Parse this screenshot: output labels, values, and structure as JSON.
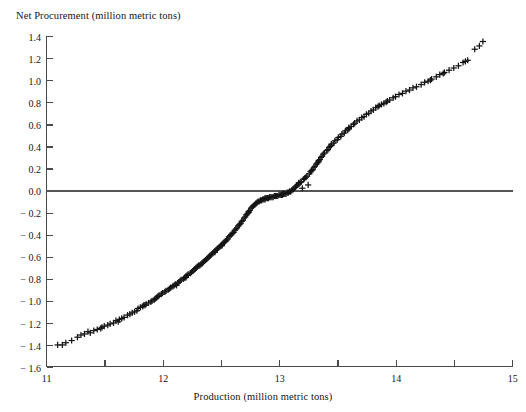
{
  "figure": {
    "caption_remnant": "",
    "background": "#ffffff",
    "ink_color": "#151515"
  },
  "chart_data": {
    "type": "scatter",
    "title": "",
    "ylabel": "Net Procurement (million metric tons)",
    "xlabel": "Production (million metric tons)",
    "xlim": [
      11,
      15
    ],
    "ylim": [
      -1.6,
      1.4
    ],
    "grid": false,
    "legend": null,
    "marker": "plus",
    "marker_color": "#151515",
    "reference_line": {
      "orientation": "horizontal",
      "y": 0.0,
      "color": "#555555"
    },
    "xticks": [
      11,
      11.5,
      12,
      12.5,
      13,
      13.5,
      14,
      14.5,
      15
    ],
    "xtick_labels": [
      "11",
      "",
      "12",
      "",
      "13",
      "",
      "14",
      "",
      "15"
    ],
    "yticks": [
      1.4,
      1.2,
      1.0,
      0.8,
      0.6,
      0.4,
      0.2,
      0.0,
      -0.2,
      -0.4,
      -0.6,
      -0.8,
      -1.0,
      -1.2,
      -1.4,
      -1.6
    ],
    "ytick_labels": [
      "1.4",
      "1.2",
      "1.0",
      "0.8",
      "0.6",
      "0.4",
      "0.2",
      "0.0",
      "− 0.2",
      "− 0.4",
      "− 0.6",
      "− 0.8",
      "− 1.0",
      "− 1.2",
      "− 1.4",
      "− 1.6"
    ],
    "n_points": 212,
    "points": [
      [
        11.1,
        -1.4
      ],
      [
        11.14,
        -1.4
      ],
      [
        11.17,
        -1.38
      ],
      [
        11.22,
        -1.36
      ],
      [
        11.27,
        -1.33
      ],
      [
        11.33,
        -1.3
      ],
      [
        11.36,
        -1.28
      ],
      [
        11.38,
        -1.29
      ],
      [
        11.41,
        -1.27
      ],
      [
        11.44,
        -1.26
      ],
      [
        11.47,
        -1.25
      ],
      [
        11.5,
        -1.23
      ],
      [
        11.53,
        -1.22
      ],
      [
        11.55,
        -1.21
      ],
      [
        11.58,
        -1.2
      ],
      [
        11.6,
        -1.18
      ],
      [
        11.62,
        -1.19
      ],
      [
        11.65,
        -1.16
      ],
      [
        11.67,
        -1.15
      ],
      [
        11.7,
        -1.13
      ],
      [
        11.72,
        -1.12
      ],
      [
        11.74,
        -1.11
      ],
      [
        11.76,
        -1.1
      ],
      [
        11.78,
        -1.09
      ],
      [
        11.79,
        -1.07
      ],
      [
        11.81,
        -1.06
      ],
      [
        11.83,
        -1.05
      ],
      [
        11.85,
        -1.04
      ],
      [
        11.86,
        -1.03
      ],
      [
        11.88,
        -1.02
      ],
      [
        11.9,
        -1.01
      ],
      [
        11.91,
        -1.0
      ],
      [
        11.93,
        -0.99
      ],
      [
        11.94,
        -0.98
      ],
      [
        11.96,
        -0.96
      ],
      [
        11.97,
        -0.95
      ],
      [
        11.99,
        -0.94
      ],
      [
        12.0,
        -0.93
      ],
      [
        12.02,
        -0.92
      ],
      [
        12.03,
        -0.91
      ],
      [
        12.05,
        -0.9
      ],
      [
        12.06,
        -0.89
      ],
      [
        12.07,
        -0.88
      ],
      [
        12.09,
        -0.87
      ],
      [
        12.1,
        -0.86
      ],
      [
        12.11,
        -0.85
      ],
      [
        12.13,
        -0.84
      ],
      [
        12.14,
        -0.83
      ],
      [
        12.15,
        -0.82
      ],
      [
        12.16,
        -0.81
      ],
      [
        12.18,
        -0.8
      ],
      [
        12.19,
        -0.79
      ],
      [
        12.2,
        -0.78
      ],
      [
        12.21,
        -0.77
      ],
      [
        12.22,
        -0.76
      ],
      [
        12.24,
        -0.75
      ],
      [
        12.25,
        -0.74
      ],
      [
        12.26,
        -0.73
      ],
      [
        12.27,
        -0.72
      ],
      [
        12.28,
        -0.71
      ],
      [
        12.29,
        -0.7
      ],
      [
        12.3,
        -0.69
      ],
      [
        12.31,
        -0.68
      ],
      [
        12.33,
        -0.67
      ],
      [
        12.34,
        -0.66
      ],
      [
        12.35,
        -0.65
      ],
      [
        12.36,
        -0.64
      ],
      [
        12.37,
        -0.63
      ],
      [
        12.38,
        -0.62
      ],
      [
        12.39,
        -0.61
      ],
      [
        12.4,
        -0.6
      ],
      [
        12.41,
        -0.59
      ],
      [
        12.42,
        -0.58
      ],
      [
        12.43,
        -0.57
      ],
      [
        12.44,
        -0.56
      ],
      [
        12.45,
        -0.55
      ],
      [
        12.46,
        -0.54
      ],
      [
        12.47,
        -0.53
      ],
      [
        12.48,
        -0.52
      ],
      [
        12.49,
        -0.51
      ],
      [
        12.5,
        -0.5
      ],
      [
        12.51,
        -0.49
      ],
      [
        12.52,
        -0.48
      ],
      [
        12.53,
        -0.47
      ],
      [
        12.54,
        -0.46
      ],
      [
        12.55,
        -0.45
      ],
      [
        12.56,
        -0.44
      ],
      [
        12.57,
        -0.42
      ],
      [
        12.58,
        -0.41
      ],
      [
        12.59,
        -0.4
      ],
      [
        12.6,
        -0.39
      ],
      [
        12.61,
        -0.38
      ],
      [
        12.62,
        -0.36
      ],
      [
        12.63,
        -0.35
      ],
      [
        12.64,
        -0.34
      ],
      [
        12.65,
        -0.32
      ],
      [
        12.66,
        -0.31
      ],
      [
        12.67,
        -0.3
      ],
      [
        12.68,
        -0.28
      ],
      [
        12.69,
        -0.27
      ],
      [
        12.7,
        -0.25
      ],
      [
        12.71,
        -0.24
      ],
      [
        12.72,
        -0.22
      ],
      [
        12.73,
        -0.21
      ],
      [
        12.74,
        -0.19
      ],
      [
        12.75,
        -0.18
      ],
      [
        12.76,
        -0.16
      ],
      [
        12.77,
        -0.15
      ],
      [
        12.78,
        -0.14
      ],
      [
        12.79,
        -0.13
      ],
      [
        12.8,
        -0.12
      ],
      [
        12.81,
        -0.11
      ],
      [
        12.82,
        -0.1
      ],
      [
        12.83,
        -0.1
      ],
      [
        12.84,
        -0.09
      ],
      [
        12.85,
        -0.09
      ],
      [
        12.86,
        -0.08
      ],
      [
        12.87,
        -0.08
      ],
      [
        12.88,
        -0.08
      ],
      [
        12.89,
        -0.07
      ],
      [
        12.9,
        -0.07
      ],
      [
        12.91,
        -0.07
      ],
      [
        12.92,
        -0.06
      ],
      [
        12.93,
        -0.06
      ],
      [
        12.94,
        -0.06
      ],
      [
        12.95,
        -0.06
      ],
      [
        12.96,
        -0.05
      ],
      [
        12.97,
        -0.05
      ],
      [
        12.98,
        -0.05
      ],
      [
        12.99,
        -0.05
      ],
      [
        13.0,
        -0.04
      ],
      [
        13.01,
        -0.04
      ],
      [
        13.02,
        -0.04
      ],
      [
        13.03,
        -0.04
      ],
      [
        13.04,
        -0.03
      ],
      [
        13.05,
        -0.03
      ],
      [
        13.06,
        -0.03
      ],
      [
        13.07,
        -0.02
      ],
      [
        13.08,
        -0.02
      ],
      [
        13.09,
        -0.01
      ],
      [
        13.1,
        -0.01
      ],
      [
        13.11,
        0.0
      ],
      [
        13.12,
        0.01
      ],
      [
        13.13,
        0.02
      ],
      [
        13.14,
        0.03
      ],
      [
        13.15,
        0.04
      ],
      [
        13.16,
        0.05
      ],
      [
        13.17,
        0.06
      ],
      [
        13.18,
        0.07
      ],
      [
        13.19,
        0.08
      ],
      [
        13.2,
        0.02
      ],
      [
        13.21,
        0.1
      ],
      [
        13.22,
        0.11
      ],
      [
        13.23,
        0.12
      ],
      [
        13.24,
        0.13
      ],
      [
        13.25,
        0.05
      ],
      [
        13.26,
        0.15
      ],
      [
        13.27,
        0.17
      ],
      [
        13.28,
        0.18
      ],
      [
        13.29,
        0.19
      ],
      [
        13.3,
        0.21
      ],
      [
        13.31,
        0.22
      ],
      [
        13.32,
        0.24
      ],
      [
        13.33,
        0.25
      ],
      [
        13.34,
        0.27
      ],
      [
        13.35,
        0.28
      ],
      [
        13.36,
        0.3
      ],
      [
        13.37,
        0.31
      ],
      [
        13.38,
        0.33
      ],
      [
        13.39,
        0.34
      ],
      [
        13.41,
        0.36
      ],
      [
        13.42,
        0.37
      ],
      [
        13.43,
        0.39
      ],
      [
        13.44,
        0.4
      ],
      [
        13.45,
        0.42
      ],
      [
        13.47,
        0.43
      ],
      [
        13.48,
        0.45
      ],
      [
        13.5,
        0.46
      ],
      [
        13.51,
        0.48
      ],
      [
        13.53,
        0.49
      ],
      [
        13.54,
        0.51
      ],
      [
        13.56,
        0.52
      ],
      [
        13.57,
        0.54
      ],
      [
        13.59,
        0.55
      ],
      [
        13.6,
        0.57
      ],
      [
        13.62,
        0.58
      ],
      [
        13.64,
        0.6
      ],
      [
        13.65,
        0.61
      ],
      [
        13.67,
        0.63
      ],
      [
        13.69,
        0.64
      ],
      [
        13.71,
        0.66
      ],
      [
        13.73,
        0.67
      ],
      [
        13.75,
        0.69
      ],
      [
        13.77,
        0.7
      ],
      [
        13.79,
        0.72
      ],
      [
        13.81,
        0.73
      ],
      [
        13.83,
        0.75
      ],
      [
        13.85,
        0.76
      ],
      [
        13.88,
        0.78
      ],
      [
        13.9,
        0.79
      ],
      [
        13.93,
        0.81
      ],
      [
        13.95,
        0.82
      ],
      [
        13.98,
        0.84
      ],
      [
        14.0,
        0.85
      ],
      [
        14.03,
        0.87
      ],
      [
        14.06,
        0.88
      ],
      [
        14.09,
        0.9
      ],
      [
        14.12,
        0.91
      ],
      [
        14.15,
        0.93
      ],
      [
        14.18,
        0.94
      ],
      [
        14.22,
        0.96
      ],
      [
        14.25,
        0.98
      ],
      [
        14.28,
        0.99
      ],
      [
        14.31,
        1.01
      ],
      [
        14.35,
        1.03
      ],
      [
        14.38,
        1.05
      ],
      [
        14.42,
        1.07
      ],
      [
        14.46,
        1.09
      ],
      [
        14.5,
        1.11
      ],
      [
        14.54,
        1.13
      ],
      [
        14.58,
        1.16
      ],
      [
        14.62,
        1.18
      ],
      [
        14.68,
        1.28
      ],
      [
        14.72,
        1.31
      ],
      [
        14.75,
        1.35
      ],
      [
        11.3,
        -1.31
      ],
      [
        11.48,
        -1.24
      ],
      [
        11.63,
        -1.17
      ],
      [
        11.84,
        -1.04
      ],
      [
        12.12,
        -0.86
      ],
      [
        12.32,
        -0.68
      ],
      [
        12.51,
        -0.5
      ],
      [
        12.74,
        -0.2
      ],
      [
        12.88,
        -0.07
      ],
      [
        13.03,
        -0.03
      ],
      [
        13.17,
        0.07
      ],
      [
        13.34,
        0.26
      ],
      [
        13.6,
        0.56
      ],
      [
        13.92,
        0.8
      ],
      [
        14.3,
        1.0
      ],
      [
        14.6,
        1.17
      ],
      [
        12.45,
        -0.56
      ],
      [
        12.2,
        -0.79
      ],
      [
        13.45,
        0.41
      ],
      [
        13.86,
        0.77
      ],
      [
        14.41,
        1.06
      ],
      [
        11.95,
        -0.97
      ]
    ]
  }
}
